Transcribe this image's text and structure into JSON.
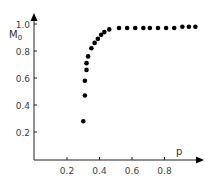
{
  "chart_data": {
    "type": "scatter",
    "title": "",
    "xlabel": "p",
    "ylabel": "M",
    "ylabel_subscript": "0",
    "xlim": [
      0,
      1.0
    ],
    "ylim": [
      0,
      1.05
    ],
    "grid": false,
    "legend": null,
    "x_ticks": [
      0.2,
      0.4,
      0.6,
      0.8
    ],
    "x_tick_labels": [
      "0.2",
      "0.4",
      "0.6",
      "0.8"
    ],
    "y_ticks": [
      0.2,
      0.4,
      0.6,
      0.8,
      1.0
    ],
    "y_tick_labels": [
      "0.2",
      "0.4",
      "0.6",
      "0.8",
      "1.0"
    ],
    "series": [
      {
        "name": "M0 vs p",
        "marker": "filled-circle",
        "color": "#000000",
        "points": [
          {
            "x": 0.3,
            "y": 0.28
          },
          {
            "x": 0.31,
            "y": 0.47
          },
          {
            "x": 0.31,
            "y": 0.58
          },
          {
            "x": 0.32,
            "y": 0.66
          },
          {
            "x": 0.32,
            "y": 0.71
          },
          {
            "x": 0.33,
            "y": 0.76
          },
          {
            "x": 0.35,
            "y": 0.82
          },
          {
            "x": 0.37,
            "y": 0.86
          },
          {
            "x": 0.39,
            "y": 0.89
          },
          {
            "x": 0.41,
            "y": 0.92
          },
          {
            "x": 0.43,
            "y": 0.94
          },
          {
            "x": 0.46,
            "y": 0.96
          },
          {
            "x": 0.52,
            "y": 0.97
          },
          {
            "x": 0.57,
            "y": 0.97
          },
          {
            "x": 0.62,
            "y": 0.97
          },
          {
            "x": 0.67,
            "y": 0.97
          },
          {
            "x": 0.71,
            "y": 0.97
          },
          {
            "x": 0.76,
            "y": 0.97
          },
          {
            "x": 0.81,
            "y": 0.97
          },
          {
            "x": 0.86,
            "y": 0.97
          },
          {
            "x": 0.91,
            "y": 0.98
          },
          {
            "x": 0.95,
            "y": 0.98
          },
          {
            "x": 0.99,
            "y": 0.98
          }
        ]
      }
    ]
  }
}
